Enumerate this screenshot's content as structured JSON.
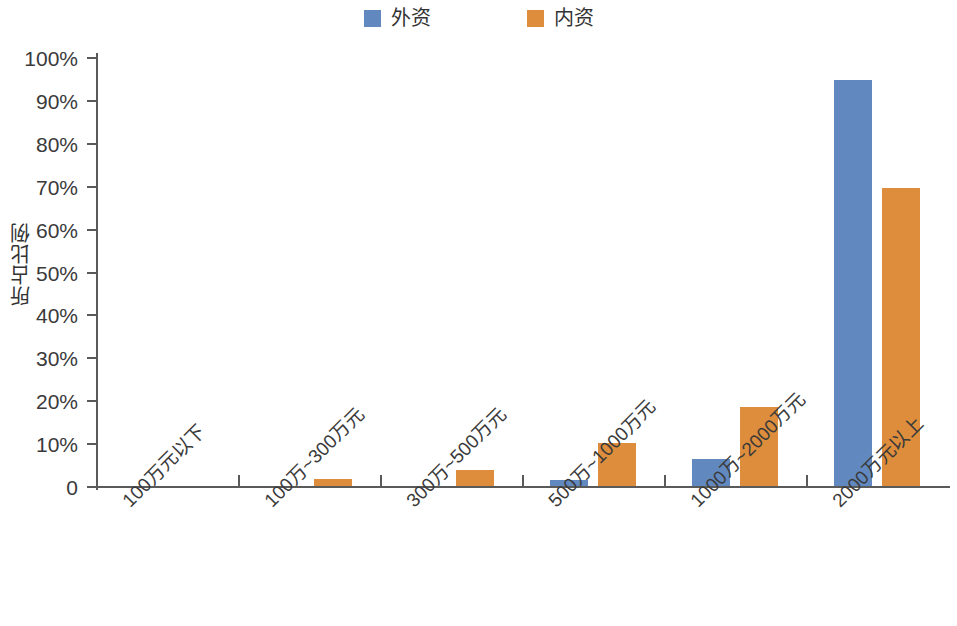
{
  "chart_data": {
    "type": "bar",
    "title": "",
    "xlabel": "",
    "ylabel": "所占比例",
    "ylim": [
      0,
      100
    ],
    "yunit": "%",
    "grid": false,
    "legend_position": "top-center",
    "categories": [
      "100万元以下",
      "100万~300万元",
      "300万~500万元",
      "500万~1000万元",
      "1000万~2000万元",
      "2000万元以上"
    ],
    "ytick_labels": [
      "100%",
      "90%",
      "80%",
      "70%",
      "60%",
      "50%",
      "40%",
      "30%",
      "20%",
      "10%",
      "0"
    ],
    "ytick_values": [
      100,
      90,
      80,
      70,
      60,
      50,
      40,
      30,
      20,
      10,
      0
    ],
    "series": [
      {
        "name": "外资",
        "color": "#6189c0",
        "values": [
          0,
          0,
          0,
          1.5,
          6.3,
          94.6
        ]
      },
      {
        "name": "内资",
        "color": "#dd8d3b",
        "values": [
          0,
          1.6,
          3.7,
          10.0,
          18.4,
          69.5
        ]
      }
    ]
  },
  "legend": {
    "entries": [
      {
        "label": "外资",
        "color": "#6189c0"
      },
      {
        "label": "内资",
        "color": "#dd8d3b"
      }
    ]
  }
}
